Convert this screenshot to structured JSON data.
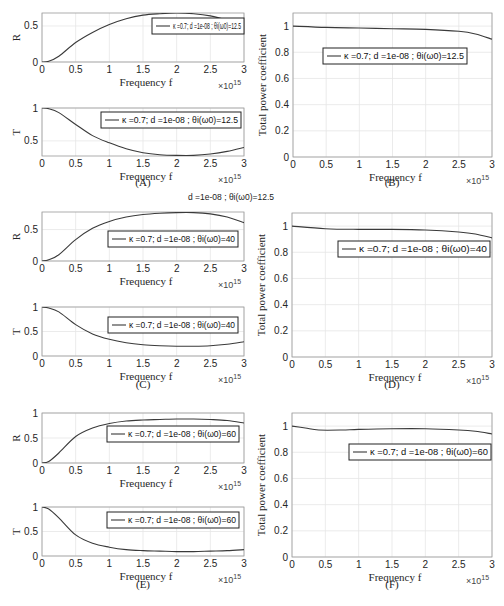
{
  "figure": {
    "stray_text": "d =1e-08 ; θi(ω0)=12.5",
    "panels": [
      {
        "id": "A",
        "caption": "(A)"
      },
      {
        "id": "B",
        "caption": "(B)"
      },
      {
        "id": "C",
        "caption": "(C)"
      },
      {
        "id": "D",
        "caption": "(D)"
      },
      {
        "id": "E",
        "caption": "(E)"
      },
      {
        "id": "F",
        "caption": "(F)"
      }
    ],
    "x_label": "Frequency f",
    "x_exponent": "×10",
    "x_exponent_power": "15",
    "x_ticks": [
      "0",
      "0.5",
      "1",
      "1.5",
      "2",
      "2.5",
      "3"
    ]
  },
  "chart_data": [
    {
      "panel": "A",
      "subplot": "R",
      "type": "line",
      "title": "",
      "xlabel": "Frequency f",
      "ylabel": "R",
      "xlim": [
        0,
        3
      ],
      "ylim": [
        0,
        0.68
      ],
      "x_scale": "×10^15",
      "yticks": [
        0,
        0.5
      ],
      "legend": "κ =0.7; d =1e-08 ; θi(ω0)=12.5",
      "grid": true,
      "x": [
        0,
        0.1,
        0.25,
        0.5,
        0.75,
        1,
        1.25,
        1.5,
        1.75,
        2,
        2.25,
        2.5,
        2.75,
        3
      ],
      "values": [
        0,
        0.01,
        0.08,
        0.27,
        0.41,
        0.52,
        0.6,
        0.65,
        0.67,
        0.68,
        0.67,
        0.64,
        0.58,
        0.5
      ]
    },
    {
      "panel": "A",
      "subplot": "T",
      "type": "line",
      "xlabel": "Frequency f",
      "ylabel": "T",
      "xlim": [
        0,
        3
      ],
      "ylim": [
        0.27,
        1.0
      ],
      "yticks": [
        0.5,
        1
      ],
      "legend": "κ =0.7; d =1e-08 ; θi(ω0)=12.5",
      "grid": true,
      "x": [
        0,
        0.1,
        0.25,
        0.5,
        0.75,
        1,
        1.25,
        1.5,
        1.75,
        2,
        2.25,
        2.5,
        2.75,
        3
      ],
      "values": [
        1,
        0.99,
        0.93,
        0.75,
        0.58,
        0.47,
        0.38,
        0.32,
        0.29,
        0.28,
        0.28,
        0.3,
        0.34,
        0.4
      ]
    },
    {
      "panel": "B",
      "type": "line",
      "xlabel": "Frequency f",
      "ylabel": "Total power coefficient",
      "xlim": [
        0,
        3
      ],
      "ylim": [
        0,
        1.1
      ],
      "yticks": [
        0,
        0.2,
        0.4,
        0.6,
        0.8,
        1
      ],
      "legend": "κ =0.7; d =1e-08 ; θi(ω0)=12.5",
      "grid": true,
      "x": [
        0,
        0.5,
        1,
        1.5,
        2,
        2.5,
        2.75,
        3
      ],
      "values": [
        1,
        0.99,
        0.985,
        0.98,
        0.975,
        0.96,
        0.94,
        0.9
      ]
    },
    {
      "panel": "C",
      "subplot": "R",
      "type": "line",
      "xlabel": "Frequency f",
      "ylabel": "R",
      "xlim": [
        0,
        3
      ],
      "ylim": [
        0,
        0.78
      ],
      "yticks": [
        0,
        0.5
      ],
      "legend": "κ =0.7; d =1e-08 ; θi(ω0)=40",
      "grid": true,
      "x": [
        0,
        0.1,
        0.25,
        0.5,
        0.75,
        1,
        1.25,
        1.5,
        1.75,
        2,
        2.25,
        2.5,
        2.75,
        3
      ],
      "values": [
        0,
        0.02,
        0.1,
        0.34,
        0.52,
        0.63,
        0.7,
        0.74,
        0.76,
        0.77,
        0.77,
        0.75,
        0.7,
        0.61
      ]
    },
    {
      "panel": "C",
      "subplot": "T",
      "type": "line",
      "xlabel": "Frequency f",
      "ylabel": "T",
      "xlim": [
        0,
        3
      ],
      "ylim": [
        0,
        1.0
      ],
      "yticks": [
        0,
        0.5,
        1
      ],
      "legend": "κ =0.7; d =1e-08 ; θi(ω0)=40",
      "grid": true,
      "x": [
        0,
        0.1,
        0.25,
        0.5,
        0.75,
        1,
        1.25,
        1.5,
        1.75,
        2,
        2.25,
        2.5,
        2.75,
        3
      ],
      "values": [
        1,
        0.98,
        0.9,
        0.64,
        0.45,
        0.34,
        0.27,
        0.23,
        0.21,
        0.2,
        0.2,
        0.21,
        0.24,
        0.29
      ]
    },
    {
      "panel": "D",
      "type": "line",
      "xlabel": "Frequency f",
      "ylabel": "Total power coefficient",
      "xlim": [
        0,
        3
      ],
      "ylim": [
        0,
        1.1
      ],
      "yticks": [
        0,
        0.2,
        0.4,
        0.6,
        0.8,
        1
      ],
      "legend": "κ =0.7; d =1e-08 ; θi(ω0)=40",
      "grid": true,
      "x": [
        0,
        0.5,
        1,
        1.5,
        2,
        2.5,
        2.75,
        3
      ],
      "values": [
        1,
        0.98,
        0.975,
        0.975,
        0.97,
        0.955,
        0.94,
        0.91
      ]
    },
    {
      "panel": "E",
      "subplot": "R",
      "type": "line",
      "xlabel": "Frequency f",
      "ylabel": "R",
      "xlim": [
        0,
        3
      ],
      "ylim": [
        0,
        1.0
      ],
      "yticks": [
        0,
        0.5,
        1
      ],
      "legend": "κ =0.7; d =1e-08 ; θi(ω0)=60",
      "grid": true,
      "x": [
        0,
        0.1,
        0.25,
        0.5,
        0.75,
        1,
        1.25,
        1.5,
        1.75,
        2,
        2.25,
        2.5,
        2.75,
        3
      ],
      "values": [
        0,
        0.03,
        0.2,
        0.53,
        0.7,
        0.79,
        0.84,
        0.86,
        0.87,
        0.88,
        0.88,
        0.87,
        0.85,
        0.8
      ]
    },
    {
      "panel": "E",
      "subplot": "T",
      "type": "line",
      "xlabel": "Frequency f",
      "ylabel": "T",
      "xlim": [
        0,
        3
      ],
      "ylim": [
        0,
        1.0
      ],
      "yticks": [
        0,
        0.5,
        1
      ],
      "legend": "κ =0.7; d =1e-08 ; θi(ω0)=60",
      "grid": true,
      "x": [
        0,
        0.1,
        0.25,
        0.5,
        0.75,
        1,
        1.25,
        1.5,
        1.75,
        2,
        2.25,
        2.5,
        2.75,
        3
      ],
      "values": [
        1,
        0.96,
        0.78,
        0.43,
        0.26,
        0.18,
        0.13,
        0.11,
        0.1,
        0.09,
        0.09,
        0.1,
        0.11,
        0.13
      ]
    },
    {
      "panel": "F",
      "type": "line",
      "xlabel": "Frequency f",
      "ylabel": "Total power coefficient",
      "xlim": [
        0,
        3
      ],
      "ylim": [
        0,
        1.1
      ],
      "yticks": [
        0,
        0.2,
        0.4,
        0.6,
        0.8,
        1
      ],
      "legend": "κ =0.7; d =1e-08 ; θi(ω0)=60",
      "grid": true,
      "x": [
        0,
        0.2,
        0.4,
        0.75,
        1,
        1.5,
        2,
        2.5,
        2.75,
        3
      ],
      "values": [
        1,
        0.985,
        0.97,
        0.97,
        0.975,
        0.98,
        0.98,
        0.97,
        0.96,
        0.94
      ]
    }
  ],
  "layout": [
    {
      "l": 42,
      "t": 13,
      "r": 244,
      "b": 62,
      "legend_box": [
        152,
        18,
        92,
        16
      ],
      "legend_text_x": 158
    },
    {
      "l": 42,
      "t": 108,
      "r": 244,
      "b": 156,
      "legend_box": [
        101,
        112,
        140,
        16
      ],
      "legend_text_x": 107
    },
    {
      "l": 293,
      "t": 13,
      "r": 492,
      "b": 157,
      "legend_box": [
        323,
        48,
        144,
        16
      ],
      "legend_text_x": 329
    },
    {
      "l": 42,
      "t": 212,
      "r": 244,
      "b": 261,
      "legend_box": [
        108,
        231,
        130,
        16
      ],
      "legend_text_x": 114
    },
    {
      "l": 42,
      "t": 307,
      "r": 244,
      "b": 356,
      "legend_box": [
        108,
        317,
        130,
        16
      ],
      "legend_text_x": 114
    },
    {
      "l": 292,
      "t": 213,
      "r": 492,
      "b": 357,
      "legend_box": [
        338,
        241,
        152,
        16
      ],
      "legend_text_x": 344
    },
    {
      "l": 42,
      "t": 413,
      "r": 244,
      "b": 463,
      "legend_box": [
        107,
        426,
        132,
        16
      ],
      "legend_text_x": 113
    },
    {
      "l": 42,
      "t": 507,
      "r": 244,
      "b": 556,
      "legend_box": [
        107,
        512,
        132,
        16
      ],
      "legend_text_x": 113
    },
    {
      "l": 292,
      "t": 413,
      "r": 492,
      "b": 557,
      "legend_box": [
        349,
        444,
        142,
        16
      ],
      "legend_text_x": 355
    }
  ],
  "captions_layout": [
    {
      "x": 143,
      "y": 186
    },
    {
      "x": 392,
      "y": 186
    },
    {
      "x": 143,
      "y": 388
    },
    {
      "x": 392,
      "y": 388
    },
    {
      "x": 143,
      "y": 588
    },
    {
      "x": 392,
      "y": 588
    }
  ]
}
